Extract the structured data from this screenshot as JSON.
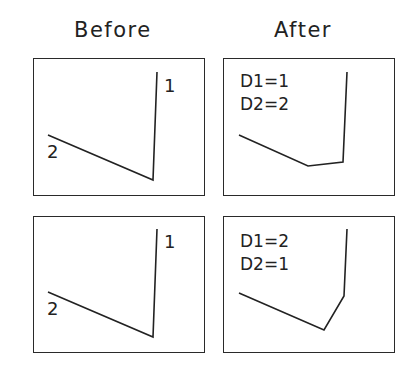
{
  "headings": {
    "before": "Before",
    "after": "After"
  },
  "colors": {
    "ink": "#222222",
    "frame": "#2a2a2a",
    "background": "#ffffff"
  },
  "panels": [
    {
      "id": "before-top",
      "column": "Before",
      "row": 1,
      "box": {
        "x": 33,
        "y": 58,
        "w": 172,
        "h": 138
      },
      "polyline": [
        [
          48,
          135
        ],
        [
          153,
          180
        ],
        [
          157,
          72
        ]
      ],
      "labels": [
        {
          "text": "1",
          "x": 164,
          "y": 92
        },
        {
          "text": "2",
          "x": 47,
          "y": 158
        }
      ],
      "params": []
    },
    {
      "id": "after-top",
      "column": "After",
      "row": 1,
      "box": {
        "x": 223,
        "y": 58,
        "w": 172,
        "h": 138
      },
      "polyline": [
        [
          239,
          135
        ],
        [
          308,
          166
        ],
        [
          343,
          162
        ],
        [
          347,
          72
        ]
      ],
      "labels": [],
      "params": [
        {
          "text": "D1=1",
          "x": 240,
          "y": 87
        },
        {
          "text": "D2=2",
          "x": 240,
          "y": 110
        }
      ]
    },
    {
      "id": "before-bottom",
      "column": "Before",
      "row": 2,
      "box": {
        "x": 33,
        "y": 216,
        "w": 172,
        "h": 137
      },
      "polyline": [
        [
          48,
          292
        ],
        [
          153,
          337
        ],
        [
          157,
          229
        ]
      ],
      "labels": [
        {
          "text": "1",
          "x": 164,
          "y": 248
        },
        {
          "text": "2",
          "x": 47,
          "y": 315
        }
      ],
      "params": []
    },
    {
      "id": "after-bottom",
      "column": "After",
      "row": 2,
      "box": {
        "x": 223,
        "y": 216,
        "w": 172,
        "h": 137
      },
      "polyline": [
        [
          239,
          293
        ],
        [
          324,
          330
        ],
        [
          344,
          296
        ],
        [
          347,
          229
        ]
      ],
      "labels": [],
      "params": [
        {
          "text": "D1=2",
          "x": 240,
          "y": 247
        },
        {
          "text": "D2=1",
          "x": 240,
          "y": 270
        }
      ]
    }
  ]
}
